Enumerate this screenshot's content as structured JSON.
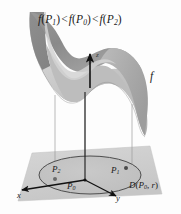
{
  "figure": {
    "name": "saddle-surface-over-disk",
    "width": 181,
    "height": 214,
    "background": "#fdfdfd"
  },
  "labels": {
    "inequality": {
      "f": "f",
      "lparen": "(",
      "rparen": ")",
      "p": "P",
      "sub1": "1",
      "sub0": "0",
      "sub2": "2",
      "less_than": "<",
      "full_text": "f(P1) < f(P0) < f(P2)"
    },
    "surface": "f",
    "axis_x": "x",
    "axis_y": "y",
    "axis_z": "z",
    "point_p0": "P",
    "point_p0_sub": "0",
    "point_p1": "P",
    "point_p1_sub": "1",
    "point_p2": "P",
    "point_p2_sub": "2",
    "disk": {
      "d": "D",
      "lparen": "(",
      "p": "P",
      "sub": "0",
      "comma": ",",
      "r": "r",
      "rparen": ")",
      "full_text": "D(P0, r)"
    }
  },
  "colors": {
    "surface_light": "#c9c9c9",
    "surface_mid": "#b4b4b4",
    "surface_dark": "#8e8e8e",
    "surface_darkest": "#7b7b7b",
    "plane": "#cfcfcf",
    "plane_edge": "#b8b8b8",
    "disk_fill": "#c4c4c4",
    "disk_stroke": "#4a4a4a",
    "axis": "#111111",
    "drop_line": "#9a9a9a",
    "text": "#1a1a1a",
    "background": "#fdfdfd"
  },
  "geometry": {
    "arrow_z_label": "vertical up arrow at origin",
    "drop_line_count": 3,
    "disk_center_label": "P0",
    "disk_radius_label": "r"
  }
}
